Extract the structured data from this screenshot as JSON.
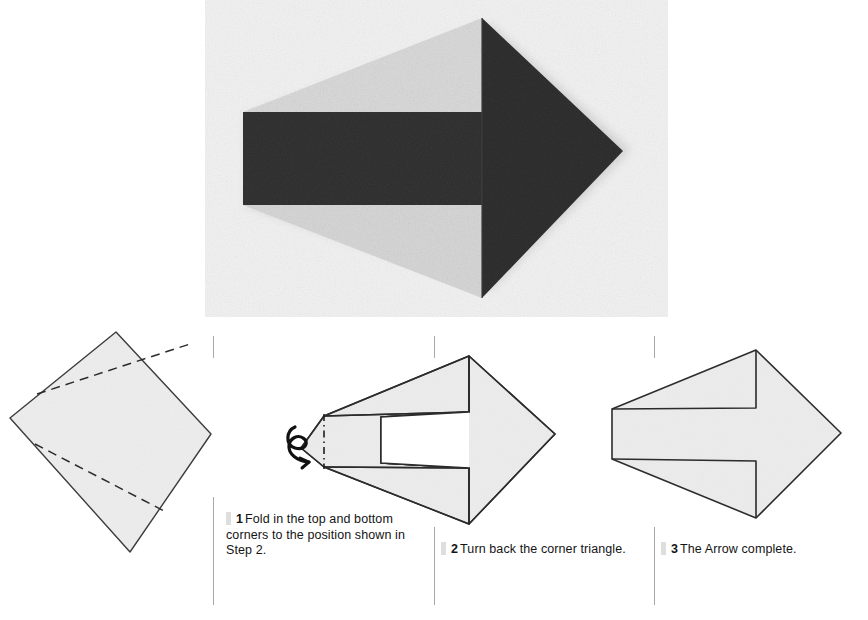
{
  "page": {
    "background_color": "#ffffff",
    "ink_color": "#1a1a1a"
  },
  "photo": {
    "name": "finished-arrow-photograph",
    "subject": "Folded paper arrow pointing right",
    "paper_front_color": "#2b2b2b",
    "paper_back_color": "#d9d9d9",
    "backdrop_color": "#f0f0f0"
  },
  "steps": [
    {
      "number": "1",
      "text": "Fold in the top and bottom corners to the position shown in Step 2.",
      "diagram_name": "step1-square-with-fold-lines",
      "diagram_note": "Square sheet rotated, with two dashed valley-fold lines"
    },
    {
      "number": "2",
      "text": "Turn back the corner triangle.",
      "diagram_name": "step2-arrow-with-turn-back-symbol",
      "diagram_note": "Arrow shape with looping turn-back arrow and dash-dot fold line at left tip"
    },
    {
      "number": "3",
      "text": "The Arrow complete.",
      "diagram_name": "step3-completed-arrow",
      "diagram_note": "Completed arrow outline"
    }
  ],
  "style_tokens": {
    "rule_color": "#a8a8a8",
    "marker_color": "#dedede",
    "outline_color": "#2a2a2a",
    "paper_fill": "#eeeeee"
  }
}
